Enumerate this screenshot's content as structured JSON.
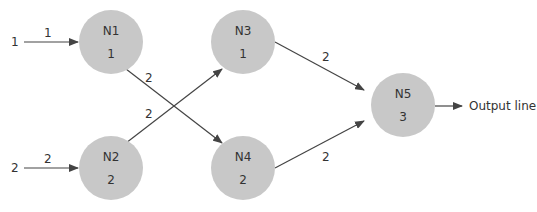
{
  "diagram": {
    "type": "neural-network",
    "nodes": [
      {
        "id": "N1",
        "value": "1"
      },
      {
        "id": "N2",
        "value": "2"
      },
      {
        "id": "N3",
        "value": "1"
      },
      {
        "id": "N4",
        "value": "2"
      },
      {
        "id": "N5",
        "value": "3"
      }
    ],
    "inputs": [
      {
        "value": "1",
        "weight": "1",
        "to": "N1"
      },
      {
        "value": "2",
        "weight": "2",
        "to": "N2"
      }
    ],
    "edges": [
      {
        "from": "N1",
        "to": "N4",
        "weight": "2"
      },
      {
        "from": "N2",
        "to": "N3",
        "weight": "2"
      },
      {
        "from": "N3",
        "to": "N5",
        "weight": "2"
      },
      {
        "from": "N4",
        "to": "N5",
        "weight": "2"
      }
    ],
    "output": {
      "label": "Output line"
    },
    "colors": {
      "node_fill": "#c8c8c8",
      "line": "#444444",
      "text": "#333333"
    }
  }
}
